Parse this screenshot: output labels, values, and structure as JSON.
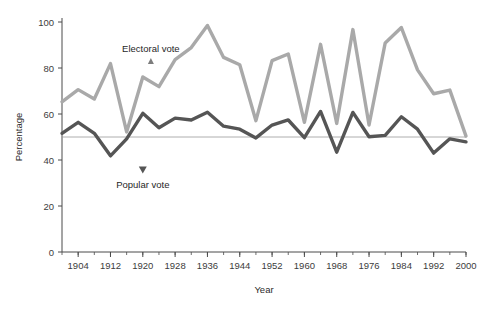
{
  "chart_data": {
    "type": "line",
    "title": "",
    "xlabel": "Year",
    "ylabel": "Percentage",
    "xlim": [
      1900,
      2000
    ],
    "ylim": [
      0,
      100
    ],
    "grid": false,
    "legend_position": "inline-annotation",
    "x_ticks": [
      1904,
      1912,
      1920,
      1928,
      1936,
      1944,
      1952,
      1960,
      1968,
      1976,
      1984,
      1992,
      2000
    ],
    "x_minor_tick_step": 4,
    "y_ticks": [
      0,
      20,
      40,
      60,
      80,
      100
    ],
    "reference_line": {
      "value": 50,
      "color": "#9a9a9a"
    },
    "x": [
      1900,
      1904,
      1908,
      1912,
      1916,
      1920,
      1924,
      1928,
      1932,
      1936,
      1940,
      1944,
      1948,
      1952,
      1956,
      1960,
      1964,
      1968,
      1972,
      1976,
      1980,
      1984,
      1988,
      1992,
      1996,
      2000
    ],
    "series": [
      {
        "name": "Electoral vote",
        "color": "#a9a9a9",
        "values": [
          65.3,
          70.6,
          66.5,
          81.9,
          52.2,
          76.1,
          71.9,
          83.6,
          88.9,
          98.5,
          84.6,
          81.4,
          57.1,
          83.2,
          86.1,
          56.4,
          90.3,
          55.9,
          96.7,
          55.2,
          90.9,
          97.6,
          79.2,
          68.8,
          70.4,
          50.4
        ]
      },
      {
        "name": "Popular vote",
        "color": "#555555",
        "values": [
          51.6,
          56.4,
          51.6,
          41.8,
          49.2,
          60.3,
          54.0,
          58.2,
          57.4,
          60.8,
          54.7,
          53.4,
          49.6,
          55.2,
          57.4,
          49.7,
          61.1,
          43.4,
          60.7,
          50.1,
          50.7,
          58.8,
          53.4,
          43.0,
          49.2,
          47.9
        ]
      }
    ],
    "annotations": [
      {
        "text": "Electoral vote",
        "series": "Electoral vote",
        "x": 1922,
        "y": 87
      },
      {
        "text": "Popular vote",
        "series": "Popular vote",
        "x": 1920,
        "y": 28
      }
    ]
  },
  "axes": {
    "y_title": "Percentage",
    "x_title": "Year",
    "y_tick_labels": [
      "0",
      "20",
      "40",
      "60",
      "80",
      "100"
    ],
    "x_tick_labels": [
      "1904",
      "1912",
      "1920",
      "1928",
      "1936",
      "1944",
      "1952",
      "1960",
      "1968",
      "1976",
      "1984",
      "1992",
      "2000"
    ]
  },
  "labels": {
    "electoral": "Electoral vote",
    "popular": "Popular vote"
  },
  "colors": {
    "electoral": "#a9a9a9",
    "popular": "#555555",
    "axis": "#4a4a4a",
    "reference": "#9a9a9a"
  }
}
